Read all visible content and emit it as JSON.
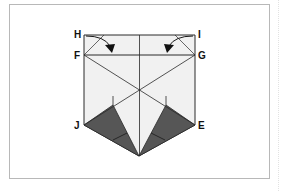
{
  "diagram": {
    "type": "origami-fold-step",
    "labels": {
      "H": "H",
      "I": "I",
      "F": "F",
      "G": "G",
      "J": "J",
      "E": "E"
    },
    "colors": {
      "paper": "#f1f1f1",
      "line": "#2a2a2a",
      "shaded": "#555555",
      "frame": "#b8b8b8"
    },
    "arrows": [
      {
        "from": "H",
        "to": "fold line F-G",
        "direction": "down-right"
      },
      {
        "from": "I",
        "to": "fold line F-G",
        "direction": "down-left"
      }
    ]
  }
}
